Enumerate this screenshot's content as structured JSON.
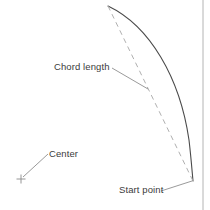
{
  "diagram": {
    "background_color": "#ffffff",
    "border_color": "#b4b4b4",
    "labels": {
      "chord_length": "Chord length",
      "center": "Center",
      "start_point": "Start point"
    },
    "colors": {
      "arc_stroke": "#4a4a4a",
      "chord_dash_stroke": "#b0b0b0",
      "leader_stroke": "#808080",
      "center_marker": "#8a8a8a",
      "text": "#3b3b3b"
    },
    "geometry": {
      "arc_start_point": [
        193,
        181
      ],
      "arc_end_point": [
        108,
        6
      ],
      "arc_bulge_point": [
        187,
        100
      ],
      "chord_endpoints": [
        [
          108,
          6
        ],
        [
          193,
          181
        ]
      ],
      "center_marker_point": [
        21,
        179
      ],
      "center_marker_size": 9,
      "leader_chord_length": [
        [
          112,
          68
        ],
        [
          148,
          89
        ]
      ],
      "leader_center": [
        [
          23,
          177
        ],
        [
          48,
          154
        ]
      ],
      "leader_start_point": [
        [
          161,
          191
        ],
        [
          192,
          181
        ]
      ],
      "right_border_x": 203
    }
  }
}
